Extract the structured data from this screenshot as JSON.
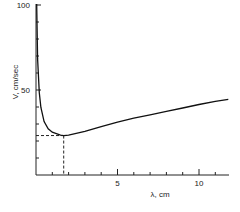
{
  "chart_data": {
    "type": "line",
    "title": "",
    "xlabel": "λ, cm",
    "ylabel": "V, cm/sec",
    "xlim": [
      0,
      11.8
    ],
    "ylim": [
      0,
      100
    ],
    "x_tick_labels": [
      "5",
      "10"
    ],
    "y_tick_labels": [
      "50",
      "100"
    ],
    "x_minor_tick_step": 1,
    "y_minor_tick_step": 10,
    "grid": false,
    "legend": null,
    "series": [
      {
        "name": "wave velocity",
        "x": [
          0.046,
          0.05,
          0.1,
          0.2,
          0.3,
          0.5,
          0.75,
          1.0,
          1.5,
          1.7,
          2,
          3,
          4,
          5,
          6,
          7,
          8,
          9,
          10,
          11,
          11.8
        ],
        "values": [
          100.6,
          96.5,
          68.3,
          48.4,
          39.7,
          31.4,
          27.2,
          25.2,
          23.4,
          23.2,
          23.4,
          25.7,
          28.5,
          31.1,
          33.5,
          35.4,
          37.5,
          39.4,
          41.5,
          43.3,
          44.5
        ]
      }
    ],
    "annotations": [
      {
        "type": "dashed-reference",
        "description": "minimum velocity",
        "x": 1.7,
        "y": 23.2
      }
    ]
  },
  "labels": {
    "x_axis": "λ, cm",
    "y_axis": "V, cm/sec",
    "x_ticks": [
      "5",
      "10"
    ],
    "y_ticks": [
      "50",
      "100"
    ]
  }
}
